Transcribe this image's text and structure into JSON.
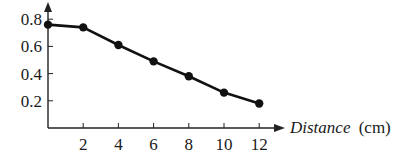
{
  "chart_data": {
    "type": "line",
    "title": "",
    "xlabel": "Distance (cm)",
    "xlabel_italic": "Distance",
    "xlabel_unit": "(cm)",
    "ylabel": "",
    "x": [
      0,
      2,
      4,
      6,
      8,
      10,
      12
    ],
    "values": [
      0.76,
      0.74,
      0.61,
      0.49,
      0.38,
      0.26,
      0.18
    ],
    "series": [
      {
        "name": "",
        "x": [
          0,
          2,
          4,
          6,
          8,
          10,
          12
        ],
        "values": [
          0.76,
          0.74,
          0.61,
          0.49,
          0.38,
          0.26,
          0.18
        ]
      }
    ],
    "xticks": [
      "2",
      "4",
      "6",
      "8",
      "10",
      "12"
    ],
    "yticks": [
      "0.2",
      "0.4",
      "0.6",
      "0.8"
    ],
    "xlim": [
      0,
      13
    ],
    "ylim": [
      0,
      0.9
    ],
    "grid": false,
    "legend": null,
    "colors": {
      "line": "#111111",
      "marker": "#111111",
      "axis": "#222222"
    }
  }
}
